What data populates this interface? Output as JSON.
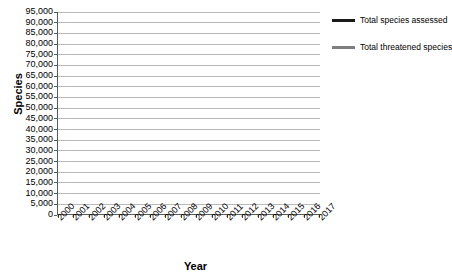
{
  "chart_data": {
    "type": "line",
    "title": "",
    "xlabel": "Year",
    "ylabel": "Species",
    "ylim": [
      0,
      95000
    ],
    "ytick_step": 5000,
    "grid": true,
    "legend_position": "right",
    "x": [
      "2000",
      "2001",
      "2002",
      "2003",
      "2004",
      "2005",
      "2006",
      "2007",
      "2008",
      "2009",
      "2010",
      "2011",
      "2012",
      "2013",
      "2014",
      "2015",
      "2016",
      "2017"
    ],
    "categories": [
      "2000",
      "2001",
      "2002",
      "2003",
      "2004",
      "2005",
      "2006",
      "2007",
      "2008",
      "2009",
      "2010",
      "2011",
      "2012",
      "2013",
      "2014",
      "2015",
      "2016",
      "2017"
    ],
    "ytick_labels": [
      "0",
      "5,000",
      "10,000",
      "15,000",
      "20,000",
      "25,000",
      "30,000",
      "35,000",
      "40,000",
      "45,000",
      "50,000",
      "55,000",
      "60,000",
      "65,000",
      "70,000",
      "75,000",
      "80,000",
      "85,000",
      "90,000",
      "95,000"
    ],
    "series": [
      {
        "name": "Total species assessed",
        "color": "#1a1a1a",
        "width": 2.6,
        "values": [
          16000,
          16000,
          16500,
          22000,
          38000,
          38500,
          40200,
          41400,
          44800,
          47700,
          55000,
          59700,
          63500,
          70300,
          76200,
          79800,
          85600,
          91500
        ]
      },
      {
        "name": "Total threatened species",
        "color": "#7f7f7f",
        "width": 2.1,
        "values": [
          11000,
          11050,
          11150,
          12250,
          15500,
          16100,
          16100,
          16300,
          16900,
          17300,
          18300,
          19200,
          20200,
          21200,
          22200,
          23000,
          24300,
          25800
        ]
      }
    ]
  },
  "legend": {
    "items": [
      {
        "label": "Total species assessed",
        "color": "#1a1a1a"
      },
      {
        "label": "Total threatened species",
        "color": "#7f7f7f"
      }
    ]
  },
  "axes": {
    "y_title": "Species",
    "x_title": "Year"
  }
}
